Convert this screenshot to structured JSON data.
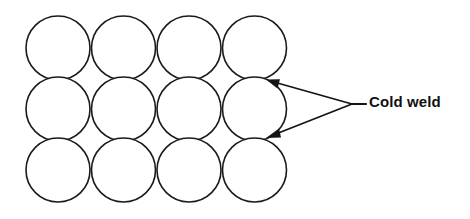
{
  "figure": {
    "background_color": "#ffffff",
    "stroke_color": "#1a1a1a",
    "width": 470,
    "height": 219
  },
  "lattice": {
    "description": "Grid of tangent circles representing contacting surface asperities",
    "rows": 3,
    "columns": 4,
    "circle_count": 12,
    "radius": 32,
    "x_pitch": 65.5,
    "y_pitch": 61,
    "origin_x": 58,
    "origin_y": 48,
    "fill_color": "#ffffff",
    "stroke_color": "#1a1a1a",
    "stroke_width": 1.6
  },
  "callout": {
    "label": "Cold weld",
    "text_color": "#111111",
    "font_size": 15,
    "converge_x": 352,
    "converge_y": 104,
    "stub_end_x": 366,
    "arrows": [
      {
        "name": "upper",
        "tip_x": 268,
        "tip_y": 80,
        "tail_x": 352,
        "tail_y": 104
      },
      {
        "name": "lower",
        "tip_x": 268,
        "tip_y": 137,
        "tail_x": 352,
        "tail_y": 104
      }
    ]
  }
}
